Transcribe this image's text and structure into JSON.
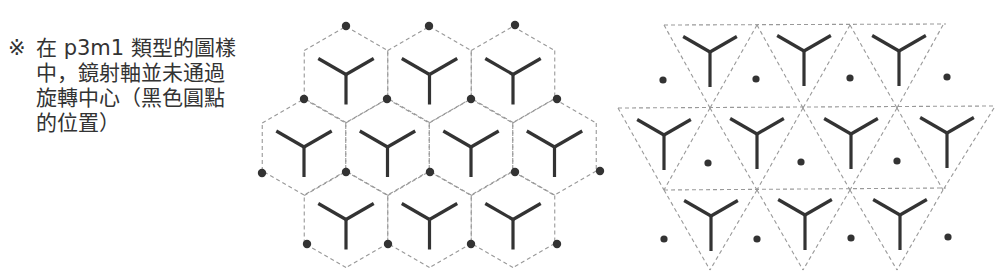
{
  "note": {
    "mark": "※",
    "lines": [
      "在 p3m1 類型的圖樣",
      "中，鏡射軸並未通過",
      "旋轉中心（黑色圓點",
      "的位置）"
    ]
  },
  "colors": {
    "stroke": "#333333",
    "dash": "#999999",
    "dot": "#333333",
    "text": "#333333"
  },
  "figures": [
    {
      "name": "hexagonal-tiling",
      "description": "Hexagon cells each containing a Y-shaped motif, rotation centers (black dots) at hexagon vertices",
      "rows": 3,
      "cells_per_row": [
        3,
        4,
        3
      ]
    },
    {
      "name": "triangular-tiling",
      "description": "Triangle cells containing Y-shaped motifs, rotation centers (black dots) in triangles without motifs",
      "rows": 3,
      "motifs_per_row": [
        3,
        4,
        3
      ]
    }
  ]
}
